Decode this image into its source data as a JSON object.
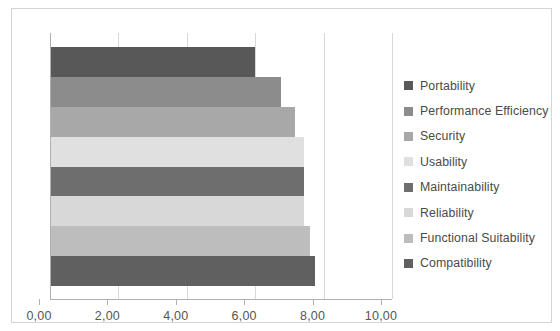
{
  "chart_data": {
    "type": "bar",
    "orientation": "horizontal",
    "title": "",
    "subtitle": "",
    "xlabel": "",
    "ylabel": "",
    "xlim": [
      0,
      10
    ],
    "grid": true,
    "legend_position": "right",
    "tick_labels": [
      "0,00",
      "2,00",
      "4,00",
      "6,00",
      "8,00",
      "10,00"
    ],
    "tick_values": [
      0,
      2,
      4,
      6,
      8,
      10
    ],
    "categories": [
      "Portability",
      "Performance Efficiency",
      "Security",
      "Usability",
      "Maintainability",
      "Reliability",
      "Functional Suitability",
      "Compatibility"
    ],
    "values": [
      6.0,
      6.75,
      7.15,
      7.43,
      7.43,
      7.43,
      7.6,
      7.76
    ],
    "colors": [
      "#585858",
      "#8c8c8c",
      "#a8a8a8",
      "#e0e0e0",
      "#6e6e6e",
      "#d8d8d8",
      "#bdbdbd",
      "#606060"
    ],
    "legend": [
      {
        "label": "Portability",
        "color": "#585858"
      },
      {
        "label": "Performance Efficiency",
        "color": "#8c8c8c"
      },
      {
        "label": "Security",
        "color": "#a8a8a8"
      },
      {
        "label": "Usability",
        "color": "#e0e0e0"
      },
      {
        "label": "Maintainability",
        "color": "#6e6e6e"
      },
      {
        "label": "Reliability",
        "color": "#d8d8d8"
      },
      {
        "label": "Functional Suitability",
        "color": "#bdbdbd"
      },
      {
        "label": "Compatibility",
        "color": "#606060"
      }
    ]
  }
}
